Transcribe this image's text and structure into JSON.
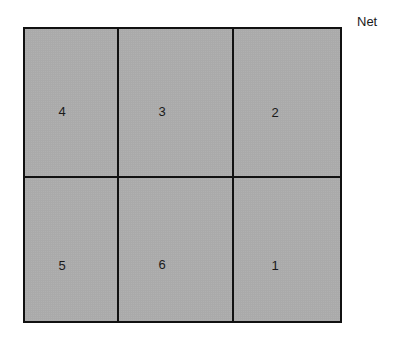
{
  "diagram": {
    "title": "Net",
    "faces": [
      {
        "label": "4",
        "row": 0,
        "col": 0
      },
      {
        "label": "3",
        "row": 0,
        "col": 1
      },
      {
        "label": "2",
        "row": 0,
        "col": 2
      },
      {
        "label": "5",
        "row": 1,
        "col": 0
      },
      {
        "label": "6",
        "row": 1,
        "col": 1
      },
      {
        "label": "1",
        "row": 1,
        "col": 2
      }
    ],
    "colors": {
      "fill": "#c6c6c6",
      "border": "#111111"
    }
  }
}
